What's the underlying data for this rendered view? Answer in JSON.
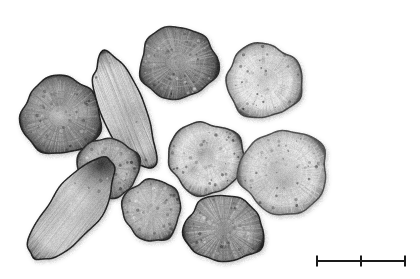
{
  "figure": {
    "kind": "photograph",
    "background_color": "#ffffff",
    "width": 420,
    "height": 279,
    "color_mode": "grayscale"
  },
  "scale_bar": {
    "name": "scale-bar",
    "label": "",
    "visible": true,
    "x_start": 317,
    "x_end": 405,
    "y": 261,
    "center_tick_x": 361,
    "tick_height": 11,
    "line_thickness": 2,
    "color": "#1a1a1a"
  },
  "specimens": [
    {
      "id": "slice-top-center-dark",
      "name": "transverse-slice-dark-top",
      "shape": "round",
      "cx": 178,
      "cy": 63,
      "rx": 39,
      "ry": 36,
      "rotation": -4,
      "fill": "#7e7e7e",
      "rim": "#2c2c2c",
      "core": "#9c9c9c",
      "core_r": 0.2,
      "texture": "radial-fine",
      "texture_strength": 0.5,
      "tone": "dark"
    },
    {
      "id": "slice-top-right-pale",
      "name": "transverse-slice-pale-top-right",
      "shape": "round",
      "cx": 264,
      "cy": 81,
      "rx": 38,
      "ry": 37,
      "rotation": 6,
      "fill": "#e3e3e3",
      "rim": "#4a4a4a",
      "core": "#d2d2d2",
      "core_r": 0.3,
      "texture": "radial-coarse",
      "texture_strength": 0.38,
      "tone": "pale"
    },
    {
      "id": "slice-left-large-grey",
      "name": "transverse-slice-grey-left",
      "shape": "round",
      "cx": 61,
      "cy": 116,
      "rx": 40,
      "ry": 39,
      "rotation": -10,
      "fill": "#8a8a8a",
      "rim": "#262626",
      "core": "#969696",
      "core_r": 0.22,
      "texture": "radial-fine",
      "texture_strength": 0.42,
      "tone": "mid"
    },
    {
      "id": "strip-fibrous-vertical",
      "name": "longitudinal-fibrous-strip",
      "shape": "elongated",
      "cx": 124,
      "cy": 111,
      "rx": 22,
      "ry": 62,
      "rotation": -22,
      "fill": "#cfcfcf",
      "rim": "#1e1e1e",
      "core": "#bdbdbd",
      "core_r": 0.0,
      "texture": "longitudinal-fibres",
      "texture_strength": 0.5,
      "tone": "pale"
    },
    {
      "id": "slice-center-pale-ring",
      "name": "transverse-slice-pale-centre",
      "shape": "round",
      "cx": 206,
      "cy": 158,
      "rx": 38,
      "ry": 36,
      "rotation": 8,
      "fill": "#dcdcdc",
      "rim": "#3a3a3a",
      "core": "#9b9b9b",
      "core_r": 0.16,
      "texture": "radial-soft",
      "texture_strength": 0.3,
      "tone": "pale"
    },
    {
      "id": "slice-right-large-pale",
      "name": "transverse-slice-pale-right",
      "shape": "round",
      "cx": 284,
      "cy": 172,
      "rx": 44,
      "ry": 42,
      "rotation": -6,
      "fill": "#dedede",
      "rim": "#555555",
      "core": "#c6c6c6",
      "core_r": 0.34,
      "texture": "radial-coarse",
      "texture_strength": 0.4,
      "tone": "pale"
    },
    {
      "id": "slice-mid-left-grey",
      "name": "transverse-slice-grey-mid-left",
      "shape": "round",
      "cx": 108,
      "cy": 168,
      "rx": 31,
      "ry": 30,
      "rotation": 12,
      "fill": "#a8a8a8",
      "rim": "#2e2e2e",
      "core": "#b2b2b2",
      "core_r": 0.24,
      "texture": "radial-fine",
      "texture_strength": 0.32,
      "tone": "mid"
    },
    {
      "id": "strip-elongated-pale-left",
      "name": "longitudinal-section-pale-left",
      "shape": "elongated",
      "cx": 73,
      "cy": 210,
      "rx": 25,
      "ry": 62,
      "rotation": 38,
      "fill": "#c9c9c9",
      "rim": "#232323",
      "core": "#bcbcbc",
      "core_r": 0.0,
      "texture": "longitudinal-soft",
      "texture_strength": 0.35,
      "tone": "pale",
      "dark_cap": true
    },
    {
      "id": "slice-bottom-mid-grey",
      "name": "transverse-slice-grey-bottom-mid",
      "shape": "round",
      "cx": 152,
      "cy": 210,
      "rx": 29,
      "ry": 31,
      "rotation": -8,
      "fill": "#b0b0b0",
      "rim": "#2b2b2b",
      "core": "#9d9d9d",
      "core_r": 0.14,
      "texture": "radial-fine",
      "texture_strength": 0.3,
      "tone": "mid"
    },
    {
      "id": "slice-bottom-right-dark",
      "name": "transverse-slice-dark-bottom",
      "shape": "round",
      "cx": 224,
      "cy": 229,
      "rx": 40,
      "ry": 33,
      "rotation": 5,
      "fill": "#909090",
      "rim": "#232323",
      "core": "#7d7d7d",
      "core_r": 0.12,
      "texture": "radial-strong",
      "texture_strength": 0.55,
      "tone": "dark"
    }
  ]
}
